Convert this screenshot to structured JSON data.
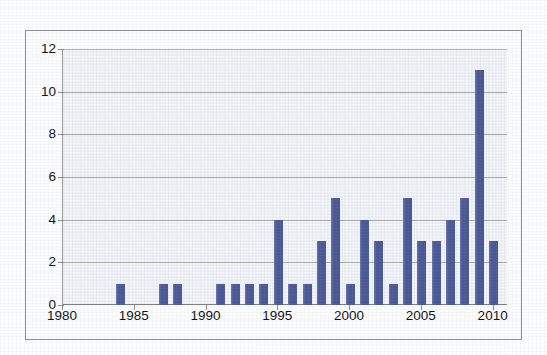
{
  "chart_data": {
    "type": "bar",
    "title": "",
    "subtitle": "",
    "xlabel": "",
    "ylabel": "",
    "xlim": [
      1980,
      2011
    ],
    "ylim": [
      0,
      12
    ],
    "grid": true,
    "legend": "none",
    "bar_color": "#4d5c99",
    "plot_background": "#f4f6f9",
    "gridline_color": "#a9a9a9",
    "x_tick_labels": [
      "1980",
      "1985",
      "1990",
      "1995",
      "2000",
      "2005",
      "2010"
    ],
    "x_tick_values": [
      1980,
      1985,
      1990,
      1995,
      2000,
      2005,
      2010
    ],
    "y_tick_labels": [
      "0",
      "2",
      "4",
      "6",
      "8",
      "10",
      "12"
    ],
    "y_tick_values": [
      0,
      2,
      4,
      6,
      8,
      10,
      12
    ],
    "categories": [
      1980,
      1981,
      1982,
      1983,
      1984,
      1985,
      1986,
      1987,
      1988,
      1989,
      1990,
      1991,
      1992,
      1993,
      1994,
      1995,
      1996,
      1997,
      1998,
      1999,
      2000,
      2001,
      2002,
      2003,
      2004,
      2005,
      2006,
      2007,
      2008,
      2009,
      2010
    ],
    "values": [
      0,
      0,
      0,
      0,
      1,
      0,
      0,
      1,
      1,
      0,
      0,
      1,
      1,
      1,
      1,
      4,
      1,
      1,
      3,
      5,
      1,
      4,
      3,
      1,
      5,
      3,
      3,
      4,
      5,
      11,
      3
    ]
  }
}
